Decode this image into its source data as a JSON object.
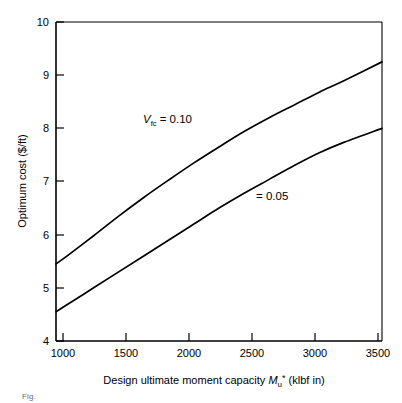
{
  "figure": {
    "caption": "Fig."
  },
  "chart_data": {
    "type": "line",
    "title": "",
    "xlabel_prefix": "Design ultimate moment capacity ",
    "xlabel_symbol": "M",
    "xlabel_sub": "u",
    "xlabel_sup": "*",
    "xlabel_suffix": " (klbf in)",
    "ylabel": "Optimum cost ($/ft)",
    "xlim": [
      900,
      3500
    ],
    "ylim": [
      4,
      10
    ],
    "xticks": [
      1000,
      1500,
      2000,
      2500,
      3000,
      3500
    ],
    "yticks": [
      4,
      5,
      6,
      7,
      8,
      9,
      10
    ],
    "grid": false,
    "legend_position": "inline-annotation",
    "series": [
      {
        "name": "V_fc = 0.10",
        "annotation_symbol": "V",
        "annotation_sub": "fc",
        "annotation_text": " = 0.10",
        "x": [
          900,
          1000,
          1200,
          1400,
          1600,
          1800,
          2000,
          2200,
          2400,
          2600,
          2800,
          3000,
          3200,
          3500
        ],
        "values": [
          5.45,
          5.62,
          5.98,
          6.35,
          6.7,
          7.03,
          7.35,
          7.65,
          7.94,
          8.2,
          8.44,
          8.68,
          8.9,
          9.25
        ]
      },
      {
        "name": "V_fc = 0.05",
        "annotation_symbol": "",
        "annotation_sub": "",
        "annotation_text": "= 0.05",
        "x": [
          900,
          1000,
          1200,
          1400,
          1600,
          1800,
          2000,
          2200,
          2400,
          2600,
          2800,
          3000,
          3200,
          3500
        ],
        "values": [
          4.55,
          4.7,
          5.0,
          5.3,
          5.6,
          5.9,
          6.2,
          6.5,
          6.78,
          7.04,
          7.3,
          7.54,
          7.74,
          8.0
        ]
      }
    ]
  }
}
